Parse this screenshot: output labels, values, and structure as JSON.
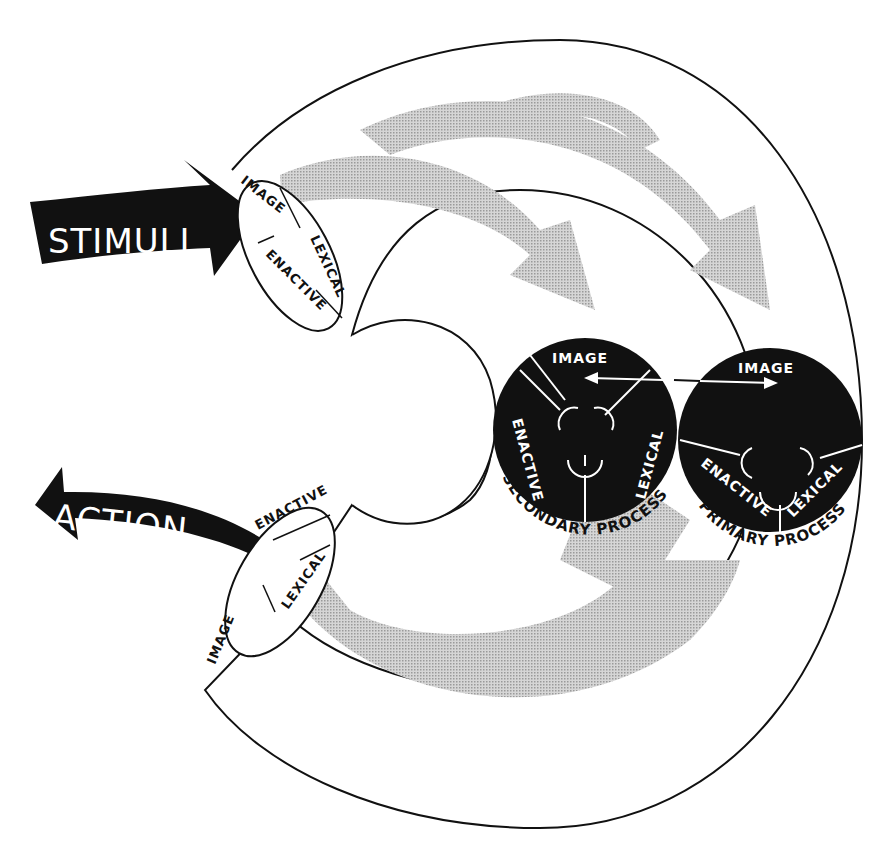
{
  "diagram": {
    "big_arrows": {
      "input": "STIMULI",
      "output": "ACTION"
    },
    "input_port": {
      "labels": [
        "IMAGE",
        "LEXICAL",
        "ENACTIVE"
      ]
    },
    "output_port": {
      "labels": [
        "ENACTIVE",
        "LEXICAL",
        "IMAGE"
      ]
    },
    "secondary_process": {
      "title": "SECONDARY PROCESS",
      "labels": [
        "IMAGE",
        "ENACTIVE",
        "LEXICAL"
      ]
    },
    "primary_process": {
      "title": "PRIMARY PROCESS",
      "labels": [
        "IMAGE",
        "ENACTIVE",
        "LEXICAL"
      ]
    },
    "colors": {
      "ink": "#111111",
      "flow_gray": "#bdbdbd",
      "background": "#ffffff"
    }
  }
}
